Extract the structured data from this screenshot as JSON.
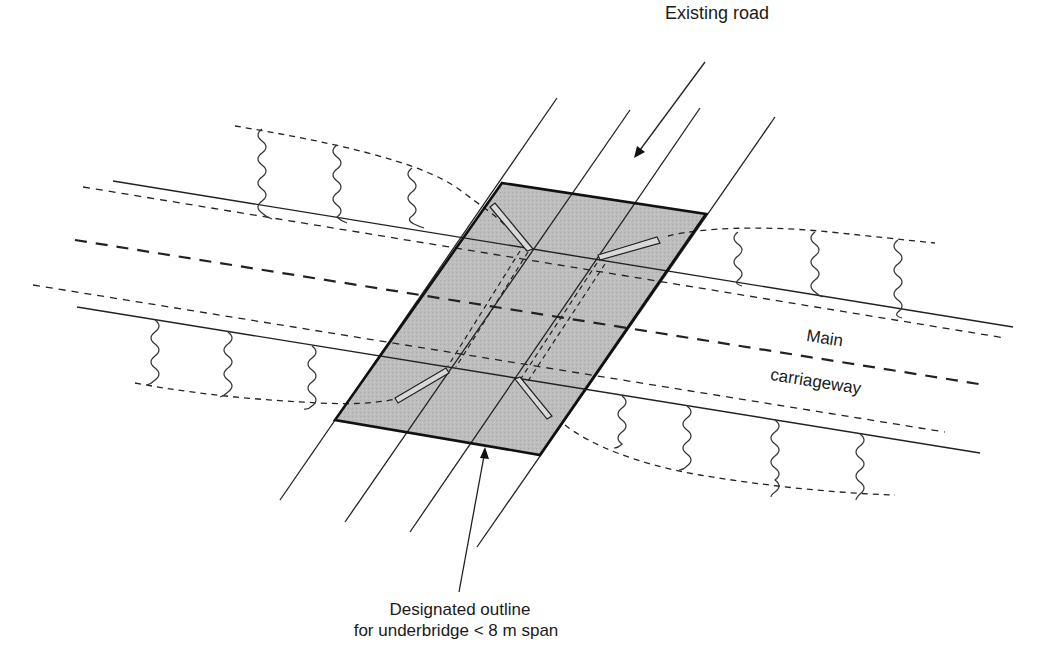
{
  "labels": {
    "existing_road": "Existing road",
    "main": "Main",
    "carriageway": "carriageway",
    "outline_line1": "Designated outline",
    "outline_line2": "for underbridge < 8 m span"
  },
  "colors": {
    "ink": "#1a1a1a",
    "shade": "#b9b9b9",
    "background": "#ffffff"
  },
  "geometry": {
    "bridge_outline": [
      [
        502,
        183
      ],
      [
        706,
        214
      ],
      [
        540,
        455
      ],
      [
        335,
        420
      ]
    ],
    "existing_road_lines": [
      [
        [
          557,
          98
        ],
        [
          280,
          500
        ]
      ],
      [
        [
          630,
          110
        ],
        [
          345,
          522
        ]
      ],
      [
        [
          700,
          108
        ],
        [
          410,
          532
        ]
      ],
      [
        [
          775,
          117
        ],
        [
          477,
          547
        ]
      ]
    ],
    "carriageway_solid_edges": [
      [
        [
          113,
          181
        ],
        [
          1013,
          327
        ]
      ],
      [
        [
          77,
          307
        ],
        [
          980,
          453
        ]
      ]
    ],
    "carriageway_inner_dashed": [
      [
        [
          83,
          187
        ],
        [
          1005,
          338
        ]
      ],
      [
        [
          33,
          285
        ],
        [
          945,
          432
        ]
      ]
    ],
    "carriageway_centre_dashed": [
      [
        75,
        240
      ],
      [
        985,
        385
      ]
    ]
  }
}
